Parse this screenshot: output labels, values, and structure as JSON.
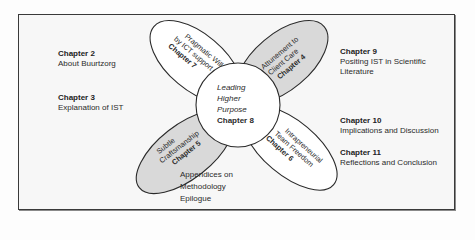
{
  "diagram": {
    "center": {
      "line1": "Leading",
      "line2": "Higher",
      "line3": "Purpose",
      "chapter": "Chapter 8"
    },
    "petals": [
      {
        "id": "top-left",
        "line1": "Pragmatic Will",
        "line2": "by ICT support",
        "chapter": "Chapter 7",
        "fill": "#ffffff"
      },
      {
        "id": "top-right",
        "line1": "Attunement to",
        "line2": "Client Care",
        "chapter": "Chapter 4",
        "fill": "#d9d9d9"
      },
      {
        "id": "bottom-left",
        "line1": "Subtle",
        "line2": "Craftsmanship",
        "chapter": "Chapter 5",
        "fill": "#d9d9d9"
      },
      {
        "id": "bottom-right",
        "line1": "Intrapreneurial",
        "line2": "Team Freedom",
        "chapter": "Chapter 6",
        "fill": "#ffffff"
      }
    ],
    "side_labels": {
      "chapter2": {
        "chapter": "Chapter 2",
        "desc": "About Buurtzorg"
      },
      "chapter3": {
        "chapter": "Chapter 3",
        "desc": "Explanation of IST"
      },
      "chapter9": {
        "chapter": "Chapter 9",
        "desc1": "Positing IST in Scientific",
        "desc2": "Literature"
      },
      "chapter10": {
        "chapter": "Chapter 10",
        "desc": "Implications and Discussion"
      },
      "chapter11": {
        "chapter": "Chapter 11",
        "desc": "Reflections and Conclusion"
      },
      "appendices": {
        "line1": "Appendices on",
        "line2": "Methodology",
        "line3": "Epilogue"
      }
    },
    "colors": {
      "outline": "#2a2a2a",
      "shaded_petal": "#d9d9d9",
      "white_petal": "#ffffff",
      "frame_bg": "#f7f7f7"
    }
  }
}
